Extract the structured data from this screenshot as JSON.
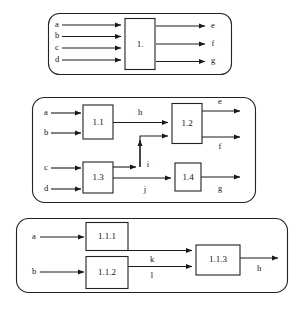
{
  "diagram": {
    "type": "block-diagram",
    "stroke_color": "#222222",
    "background_color": "#ffffff",
    "levels": [
      {
        "id": "level-1",
        "name": "top-level-system",
        "blocks": [
          {
            "id": "b1",
            "label": "1."
          }
        ],
        "inputs": [
          {
            "label": "a"
          },
          {
            "label": "b"
          },
          {
            "label": "c"
          },
          {
            "label": "d"
          }
        ],
        "outputs": [
          {
            "label": "e"
          },
          {
            "label": "f"
          },
          {
            "label": "g"
          }
        ],
        "internal_signals": []
      },
      {
        "id": "level-2",
        "name": "subsystem-decomposition",
        "blocks": [
          {
            "id": "b11",
            "label": "1.1"
          },
          {
            "id": "b12",
            "label": "1.2"
          },
          {
            "id": "b13",
            "label": "1.3"
          },
          {
            "id": "b14",
            "label": "1.4"
          }
        ],
        "inputs": [
          {
            "label": "a"
          },
          {
            "label": "b"
          },
          {
            "label": "c"
          },
          {
            "label": "d"
          }
        ],
        "outputs": [
          {
            "label": "e"
          },
          {
            "label": "f"
          },
          {
            "label": "g"
          }
        ],
        "internal_signals": [
          {
            "label": "h",
            "from": "1.1",
            "to": "1.2"
          },
          {
            "label": "i",
            "from": "1.3",
            "to": "1.2"
          },
          {
            "label": "j",
            "from": "1.3",
            "to": "1.4"
          }
        ]
      },
      {
        "id": "level-3",
        "name": "sub-subsystem-decomposition",
        "blocks": [
          {
            "id": "b111",
            "label": "1.1.1"
          },
          {
            "id": "b112",
            "label": "1.1.2"
          },
          {
            "id": "b113",
            "label": "1.1.3"
          }
        ],
        "inputs": [
          {
            "label": "a"
          },
          {
            "label": "b"
          }
        ],
        "outputs": [
          {
            "label": "h"
          }
        ],
        "internal_signals": [
          {
            "label": "k",
            "from": "1.1.1",
            "to": "1.1.3"
          },
          {
            "label": "l",
            "from": "1.1.2",
            "to": "1.1.3"
          }
        ]
      }
    ],
    "labels": {
      "l1_block": "1.",
      "l1_in_a": "a",
      "l1_in_b": "b",
      "l1_in_c": "c",
      "l1_in_d": "d",
      "l1_out_e": "e",
      "l1_out_f": "f",
      "l1_out_g": "g",
      "l2_block_11": "1.1",
      "l2_block_12": "1.2",
      "l2_block_13": "1.3",
      "l2_block_14": "1.4",
      "l2_in_a": "a",
      "l2_in_b": "b",
      "l2_in_c": "c",
      "l2_in_d": "d",
      "l2_sig_h": "h",
      "l2_sig_i": "i",
      "l2_sig_j": "j",
      "l2_out_e": "e",
      "l2_out_f": "f",
      "l2_out_g": "g",
      "l3_block_111": "1.1.1",
      "l3_block_112": "1.1.2",
      "l3_block_113": "1.1.3",
      "l3_in_a": "a",
      "l3_in_b": "b",
      "l3_sig_k": "k",
      "l3_sig_l": "l",
      "l3_out_h": "h"
    }
  }
}
